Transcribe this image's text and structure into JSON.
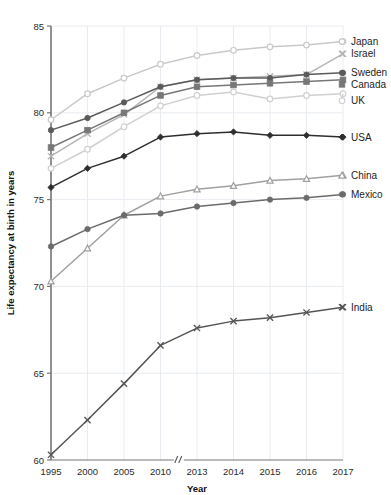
{
  "chart_data": {
    "type": "line",
    "title": "",
    "xlabel": "Year",
    "ylabel": "Life expectancy at birth in years",
    "categories": [
      "1995",
      "2000",
      "2005",
      "2010",
      "2013",
      "2014",
      "2015",
      "2016",
      "2017"
    ],
    "x_tick_labels": [
      "1995",
      "2000",
      "2005",
      "2010",
      "2013",
      "2014",
      "2015",
      "2016",
      "2017"
    ],
    "y_tick_labels": [
      "60",
      "65",
      "70",
      "75",
      "80",
      "85"
    ],
    "y_ticks": [
      60,
      65,
      70,
      75,
      80,
      85
    ],
    "ylim": [
      60,
      85
    ],
    "grid": true,
    "axis_break": true,
    "axis_break_label": "//",
    "legend_position": "right",
    "series": [
      {
        "name": "Japan",
        "marker": "circle-open",
        "color": "#c9c9c9",
        "values": [
          79.6,
          81.1,
          82.0,
          82.8,
          83.3,
          83.6,
          83.8,
          83.9,
          84.1
        ]
      },
      {
        "name": "Israel",
        "marker": "x",
        "color": "#b5b5b5",
        "values": [
          77.5,
          78.8,
          79.9,
          81.5,
          81.9,
          82.0,
          82.1,
          82.2,
          83.4
        ]
      },
      {
        "name": "Sweden",
        "marker": "circle",
        "color": "#5a5a5a",
        "values": [
          79.0,
          79.7,
          80.6,
          81.5,
          81.9,
          82.0,
          82.0,
          82.2,
          82.3
        ]
      },
      {
        "name": "Canada",
        "marker": "square",
        "color": "#777777",
        "values": [
          78.0,
          79.0,
          80.0,
          81.0,
          81.5,
          81.6,
          81.7,
          81.8,
          81.9
        ]
      },
      {
        "name": "UK",
        "marker": "circle-open",
        "color": "#d0d0d0",
        "values": [
          76.8,
          77.9,
          79.2,
          80.4,
          81.0,
          81.2,
          80.8,
          81.0,
          81.1
        ]
      },
      {
        "name": "USA",
        "marker": "diamond",
        "color": "#2e2e2e",
        "values": [
          75.7,
          76.8,
          77.5,
          78.6,
          78.8,
          78.9,
          78.7,
          78.7,
          78.6
        ]
      },
      {
        "name": "China",
        "marker": "triangle",
        "color": "#a0a0a0",
        "values": [
          70.3,
          72.2,
          74.1,
          75.2,
          75.6,
          75.8,
          76.1,
          76.2,
          76.4
        ]
      },
      {
        "name": "Mexico",
        "marker": "circle",
        "color": "#6b6b6b",
        "values": [
          72.3,
          73.3,
          74.1,
          74.2,
          74.6,
          74.8,
          75.0,
          75.1,
          75.3
        ]
      },
      {
        "name": "India",
        "marker": "x",
        "color": "#555555",
        "values": [
          60.3,
          62.3,
          64.4,
          66.6,
          67.6,
          68.0,
          68.2,
          68.5,
          68.8
        ]
      }
    ]
  },
  "legend": {
    "items": [
      {
        "label": "Japan"
      },
      {
        "label": "Israel"
      },
      {
        "label": "Sweden"
      },
      {
        "label": "Canada"
      },
      {
        "label": "UK"
      },
      {
        "label": "USA"
      },
      {
        "label": "China"
      },
      {
        "label": "Mexico"
      },
      {
        "label": "India"
      }
    ]
  },
  "axes": {
    "x_title": "Year",
    "y_title": "Life expectancy at birth in years"
  }
}
